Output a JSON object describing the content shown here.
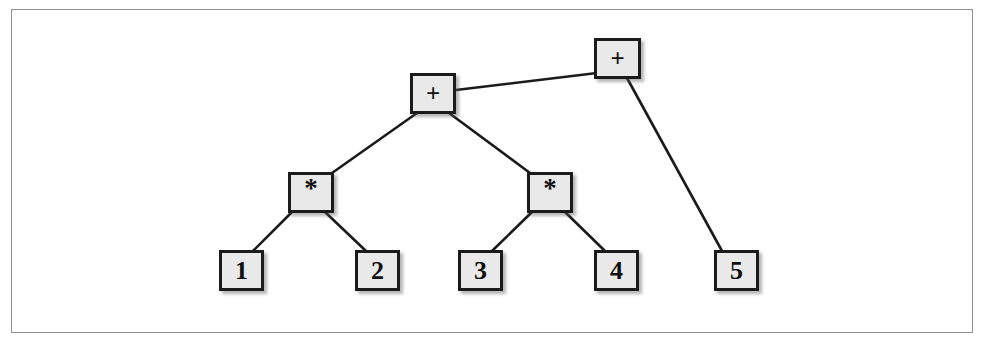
{
  "figure": {
    "kind": "expression-tree-diagram",
    "frame": {
      "x": 11,
      "y": 9,
      "width": 962,
      "height": 324,
      "border_color": "#8d8f93"
    },
    "style": {
      "node_fill": "#e9e9e9",
      "node_border": "#1b1b1b",
      "edge_color": "#1b1b1b",
      "text_color": "#101010",
      "background": "#ffffff"
    }
  },
  "chart_data": {
    "type": "diagram",
    "title": "",
    "nodes": [
      {
        "id": "root-plus",
        "label": "+",
        "kind": "operator",
        "x": 594,
        "y": 38,
        "width": 47,
        "height": 41
      },
      {
        "id": "inner-plus",
        "label": "+",
        "kind": "operator",
        "x": 410,
        "y": 73,
        "width": 46,
        "height": 41
      },
      {
        "id": "left-star",
        "label": "*",
        "kind": "operator",
        "x": 288,
        "y": 172,
        "width": 46,
        "height": 41
      },
      {
        "id": "right-star",
        "label": "*",
        "kind": "operator",
        "x": 527,
        "y": 172,
        "width": 46,
        "height": 41
      },
      {
        "id": "leaf-1",
        "label": "1",
        "kind": "leaf",
        "x": 219,
        "y": 250,
        "width": 45,
        "height": 41
      },
      {
        "id": "leaf-2",
        "label": "2",
        "kind": "leaf",
        "x": 355,
        "y": 250,
        "width": 45,
        "height": 41
      },
      {
        "id": "leaf-3",
        "label": "3",
        "kind": "leaf",
        "x": 458,
        "y": 250,
        "width": 45,
        "height": 41
      },
      {
        "id": "leaf-4",
        "label": "4",
        "kind": "leaf",
        "x": 594,
        "y": 250,
        "width": 45,
        "height": 41
      },
      {
        "id": "leaf-5",
        "label": "5",
        "kind": "leaf",
        "x": 714,
        "y": 250,
        "width": 45,
        "height": 41
      }
    ],
    "edges": [
      {
        "from": "inner-plus",
        "to": "root-plus",
        "x1": 456,
        "y1": 90,
        "x2": 597,
        "y2": 73
      },
      {
        "from": "root-plus",
        "to": "leaf-5",
        "x1": 627,
        "y1": 78,
        "x2": 722,
        "y2": 251
      },
      {
        "from": "inner-plus",
        "to": "left-star",
        "x1": 417,
        "y1": 113,
        "x2": 332,
        "y2": 173
      },
      {
        "from": "inner-plus",
        "to": "right-star",
        "x1": 449,
        "y1": 113,
        "x2": 530,
        "y2": 173
      },
      {
        "from": "left-star",
        "to": "leaf-1",
        "x1": 292,
        "y1": 212,
        "x2": 253,
        "y2": 251
      },
      {
        "from": "left-star",
        "to": "leaf-2",
        "x1": 325,
        "y1": 212,
        "x2": 366,
        "y2": 251
      },
      {
        "from": "right-star",
        "to": "leaf-3",
        "x1": 532,
        "y1": 212,
        "x2": 492,
        "y2": 251
      },
      {
        "from": "right-star",
        "to": "leaf-4",
        "x1": 565,
        "y1": 212,
        "x2": 605,
        "y2": 251
      }
    ]
  }
}
